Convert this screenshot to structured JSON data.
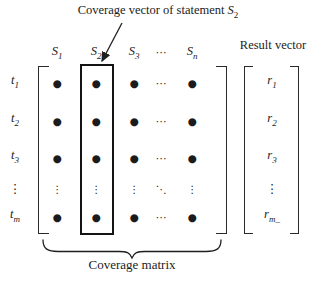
{
  "title": {
    "text": "Coverage vector of statement ",
    "var": "S",
    "var_sub": "2"
  },
  "result": {
    "label": "Result vector",
    "entries": [
      {
        "base": "r",
        "sub": "1"
      },
      {
        "base": "r",
        "sub": "2"
      },
      {
        "base": "r",
        "sub": "3"
      },
      {
        "dots": "⋮"
      },
      {
        "base": "r",
        "sub": "m_"
      }
    ]
  },
  "matrix": {
    "caption": "Coverage matrix",
    "col_headers": [
      {
        "base": "S",
        "sub": "1"
      },
      {
        "base": "S",
        "sub": "2"
      },
      {
        "base": "S",
        "sub": "3"
      },
      {
        "dots": "⋯"
      },
      {
        "base": "S",
        "sub": "n"
      }
    ],
    "row_labels": [
      {
        "base": "t",
        "sub": "1"
      },
      {
        "base": "t",
        "sub": "2"
      },
      {
        "base": "t",
        "sub": "3"
      },
      {
        "dots": "⋮"
      },
      {
        "base": "t",
        "sub": "m"
      }
    ],
    "cells": [
      [
        "●",
        "●",
        "●",
        "⋯",
        "●"
      ],
      [
        "●",
        "●",
        "●",
        "⋯",
        "●"
      ],
      [
        "●",
        "●",
        "●",
        "⋯",
        "●"
      ],
      [
        "⋮",
        "⋮",
        "⋮",
        "⋱",
        "⋮"
      ],
      [
        "●",
        "●",
        "●",
        "⋯",
        "●"
      ]
    ]
  },
  "colors": {
    "ink": "#222222",
    "box": "#141414"
  }
}
